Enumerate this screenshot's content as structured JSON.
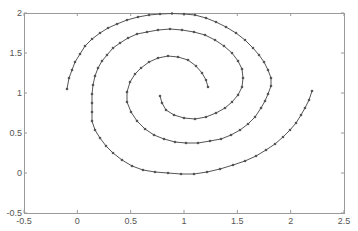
{
  "chart_data": {
    "type": "line",
    "title": "",
    "xlabel": "",
    "ylabel": "",
    "xlim": [
      -0.5,
      2.5
    ],
    "ylim": [
      -0.5,
      2
    ],
    "grid": false,
    "legend": null,
    "x_ticks": [
      "-0.5",
      "0",
      "0.5",
      "1",
      "1.5",
      "2",
      "2.5"
    ],
    "y_ticks": [
      "-0.5",
      "0",
      "0.5",
      "1",
      "1.5",
      "2"
    ],
    "x_tick_values": [
      -0.5,
      0,
      0.5,
      1,
      1.5,
      2,
      2.5
    ],
    "y_tick_values": [
      -0.5,
      0,
      0.5,
      1,
      1.5,
      2
    ],
    "colors": {
      "line": "#555555",
      "marker": "#555555",
      "axis": "#888888"
    },
    "series": [
      {
        "name": "spiral-1",
        "marker": "dot",
        "points_px": [
          [
            67,
            89
          ],
          [
            69,
            78
          ],
          [
            72,
            70
          ],
          [
            75,
            62
          ],
          [
            80,
            54
          ],
          [
            85,
            46
          ],
          [
            92,
            39
          ],
          [
            100,
            33
          ],
          [
            108,
            28
          ],
          [
            117,
            24
          ],
          [
            127,
            20
          ],
          [
            138,
            17
          ],
          [
            149,
            15
          ],
          [
            160,
            14
          ],
          [
            172,
            13.5
          ],
          [
            184,
            14
          ],
          [
            195,
            15
          ],
          [
            206,
            18
          ],
          [
            216,
            22
          ],
          [
            226,
            27
          ],
          [
            236,
            33
          ],
          [
            245,
            40
          ],
          [
            253,
            48
          ],
          [
            259,
            55
          ],
          [
            264,
            62
          ],
          [
            268,
            70
          ],
          [
            271,
            78
          ],
          [
            271,
            86
          ],
          [
            268,
            94
          ],
          [
            265,
            101
          ],
          [
            261,
            108
          ],
          [
            255,
            117
          ],
          [
            248,
            124
          ],
          [
            240,
            130
          ],
          [
            231,
            135
          ],
          [
            221,
            139
          ],
          [
            210,
            141
          ],
          [
            198,
            143
          ],
          [
            186,
            143
          ],
          [
            175,
            142
          ],
          [
            164,
            139
          ],
          [
            154,
            135
          ],
          [
            145,
            129
          ],
          [
            137,
            121
          ],
          [
            131,
            112
          ],
          [
            127,
            102
          ],
          [
            127,
            92
          ],
          [
            130,
            82
          ],
          [
            135,
            74
          ],
          [
            141,
            68
          ],
          [
            149,
            62
          ],
          [
            158,
            58
          ],
          [
            168,
            56
          ],
          [
            178,
            57
          ],
          [
            188,
            60
          ],
          [
            196,
            66
          ],
          [
            202,
            73
          ],
          [
            206,
            80
          ],
          [
            208,
            87
          ]
        ]
      },
      {
        "name": "spiral-2",
        "marker": "dot",
        "points_px": [
          [
            312,
            91
          ],
          [
            309,
            100
          ],
          [
            305,
            108
          ],
          [
            301,
            115
          ],
          [
            296,
            123
          ],
          [
            290,
            130
          ],
          [
            283,
            137
          ],
          [
            275,
            144
          ],
          [
            266,
            150
          ],
          [
            256,
            156
          ],
          [
            245,
            161
          ],
          [
            233,
            165
          ],
          [
            220,
            169
          ],
          [
            207,
            172
          ],
          [
            194,
            174
          ],
          [
            181,
            174
          ],
          [
            168,
            173
          ],
          [
            155,
            172
          ],
          [
            143,
            170
          ],
          [
            132,
            166
          ],
          [
            122,
            160
          ],
          [
            113,
            153
          ],
          [
            106,
            146
          ],
          [
            100,
            138
          ],
          [
            95,
            130
          ],
          [
            92,
            121
          ],
          [
            92,
            112
          ],
          [
            92,
            103
          ],
          [
            92,
            94
          ],
          [
            93,
            85
          ],
          [
            95,
            76
          ],
          [
            98,
            68
          ],
          [
            102,
            61
          ],
          [
            107,
            55
          ],
          [
            113,
            48
          ],
          [
            120,
            43
          ],
          [
            128,
            38
          ],
          [
            137,
            34
          ],
          [
            147,
            32
          ],
          [
            158,
            30
          ],
          [
            170,
            29
          ],
          [
            182,
            30
          ],
          [
            194,
            32
          ],
          [
            205,
            35
          ],
          [
            215,
            40
          ],
          [
            224,
            46
          ],
          [
            232,
            53
          ],
          [
            238,
            61
          ],
          [
            242,
            69
          ],
          [
            243,
            78
          ],
          [
            242,
            87
          ],
          [
            238,
            95
          ],
          [
            232,
            102
          ],
          [
            225,
            108
          ],
          [
            216,
            113
          ],
          [
            206,
            117
          ],
          [
            195,
            119
          ],
          [
            184,
            118
          ],
          [
            174,
            115
          ],
          [
            166,
            110
          ],
          [
            162,
            103
          ],
          [
            160,
            96
          ]
        ]
      }
    ]
  },
  "plot_area_px": {
    "left": 24,
    "top": 13,
    "right": 344,
    "bottom": 213
  }
}
